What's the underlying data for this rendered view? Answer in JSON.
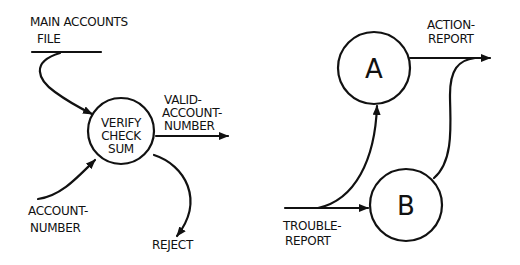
{
  "left_diagram": {
    "data_store": {
      "line1": "MAIN ACCOUNTS",
      "line2": "FILE"
    },
    "process": {
      "line1": "VERIFY",
      "line2": "CHECK",
      "line3": "SUM"
    },
    "outputs": {
      "valid": {
        "line1": "VALID-",
        "line2": "ACCOUNT-",
        "line3": "NUMBER"
      },
      "reject": "REJECT"
    },
    "input": {
      "line1": "ACCOUNT-",
      "line2": "NUMBER"
    }
  },
  "right_diagram": {
    "process_a": "A",
    "process_b": "B",
    "input": {
      "line1": "TROUBLE-",
      "line2": "REPORT"
    },
    "output": {
      "line1": "ACTION-",
      "line2": "REPORT"
    }
  },
  "colors": {
    "ink": "#111111",
    "background": "#ffffff"
  }
}
